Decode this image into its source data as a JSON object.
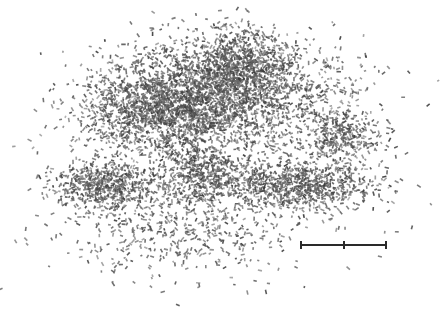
{
  "image": {
    "width": 448,
    "height": 312,
    "background": "#ffffff",
    "particle_color_dark": "#3c3c3c",
    "particle_color_light": "#7a7a7a",
    "description": "Dense cloud of small dark rod-like particles on white background"
  },
  "clusters": [
    {
      "cx": 215,
      "cy": 95,
      "rx": 105,
      "ry": 55,
      "count": 2200
    },
    {
      "cx": 150,
      "cy": 110,
      "rx": 70,
      "ry": 45,
      "count": 900
    },
    {
      "cx": 245,
      "cy": 60,
      "rx": 45,
      "ry": 35,
      "count": 500
    },
    {
      "cx": 105,
      "cy": 185,
      "rx": 50,
      "ry": 25,
      "count": 600
    },
    {
      "cx": 200,
      "cy": 175,
      "rx": 40,
      "ry": 30,
      "count": 450
    },
    {
      "cx": 300,
      "cy": 185,
      "rx": 75,
      "ry": 25,
      "count": 800
    },
    {
      "cx": 340,
      "cy": 135,
      "rx": 45,
      "ry": 25,
      "count": 350
    },
    {
      "cx": 180,
      "cy": 230,
      "rx": 110,
      "ry": 40,
      "count": 450,
      "sparse": true
    },
    {
      "cx": 330,
      "cy": 80,
      "rx": 50,
      "ry": 40,
      "count": 60,
      "sparse": true
    },
    {
      "cx": 220,
      "cy": 150,
      "rx": 190,
      "ry": 110,
      "count": 250,
      "sparse": true
    }
  ],
  "scale_bar": {
    "x_start": 301,
    "x_mid": 344,
    "x_end": 386,
    "y": 245,
    "color": "#2a2a2a",
    "label": ""
  }
}
